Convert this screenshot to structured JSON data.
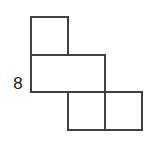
{
  "figure": {
    "kind": "geometry-diagram",
    "background_color": "#ffffff",
    "stroke_color": "#404040",
    "stroke_width": 2,
    "fill_color": "none",
    "grid": {
      "cell_size": 37,
      "x_lines": [
        31,
        68,
        105,
        142
      ],
      "y_lines": [
        17,
        55,
        92,
        130
      ]
    },
    "squares": [
      {
        "name": "square-top-left",
        "col": 0,
        "row": 0,
        "x": 31,
        "y": 17,
        "w": 37,
        "h": 38
      },
      {
        "name": "square-middle-left",
        "col": 0,
        "row": 1,
        "x": 31,
        "y": 55,
        "w": 37,
        "h": 37
      },
      {
        "name": "square-middle-right",
        "col": 1,
        "row": 1,
        "x": 68,
        "y": 55,
        "w": 37,
        "h": 37
      },
      {
        "name": "square-bottom-left",
        "col": 1,
        "row": 2,
        "x": 68,
        "y": 92,
        "w": 37,
        "h": 38
      },
      {
        "name": "square-bottom-right",
        "col": 2,
        "row": 2,
        "x": 105,
        "y": 92,
        "w": 37,
        "h": 38
      }
    ],
    "outline_path": "M31,17 L68,17 L68,55 L105,55 L105,92 L142,92 L142,130 L68,130 L68,92 L31,92 Z",
    "interior_segments": [
      {
        "name": "interior-segment-horizontal-upper",
        "x1": 31,
        "y1": 55,
        "x2": 68,
        "y2": 55
      },
      {
        "name": "interior-segment-horizontal-lower",
        "x1": 68,
        "y1": 92,
        "x2": 105,
        "y2": 92
      },
      {
        "name": "interior-segment-vertical-upper",
        "x1": 68,
        "y1": 17,
        "x2": 68,
        "y2": 55
      },
      {
        "name": "interior-segment-vertical-lower",
        "x1": 105,
        "y1": 92,
        "x2": 105,
        "y2": 130
      }
    ],
    "labels": {
      "left_side": {
        "text": "8",
        "value": 8,
        "anchor_edge": "left-vertical-edge-lower-square",
        "color": "#1a1a1a"
      }
    }
  }
}
